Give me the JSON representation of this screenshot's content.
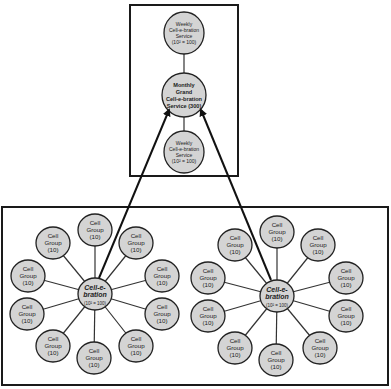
{
  "diagram": {
    "top_box": {
      "nodes": [
        {
          "id": "weekly-top",
          "lines": [
            "Weekly",
            "Cell-e-bration",
            "Service",
            "(10² = 100)"
          ],
          "cx": 184,
          "cy": 33,
          "rx": 20,
          "ry": 21
        },
        {
          "id": "monthly",
          "lines": [
            "Monthly",
            "Grand",
            "Cell-e-bration",
            "Service (300)"
          ],
          "cx": 184,
          "cy": 95,
          "rx": 22,
          "ry": 22
        },
        {
          "id": "weekly-bottom",
          "lines": [
            "Weekly",
            "Cell-e-bration",
            "Service",
            "(10² = 100)"
          ],
          "cx": 184,
          "cy": 152,
          "rx": 20,
          "ry": 21
        }
      ]
    },
    "clusters": [
      {
        "id": "left",
        "hub": {
          "title_lines": [
            "Cell-e-",
            "bration"
          ],
          "sub": "(10² = 100)",
          "cx": 95,
          "cy": 294,
          "r": 17
        },
        "satellites": [
          {
            "label_lines": [
              "Cell",
              "Group",
              "(10)"
            ],
            "cx": 95,
            "cy": 230
          },
          {
            "label_lines": [
              "Cell",
              "Group",
              "(10)"
            ],
            "cx": 136,
            "cy": 243
          },
          {
            "label_lines": [
              "Cell",
              "Group",
              "(10)"
            ],
            "cx": 162,
            "cy": 276
          },
          {
            "label_lines": [
              "Cell",
              "Group",
              "(10)"
            ],
            "cx": 162,
            "cy": 314
          },
          {
            "label_lines": [
              "Cell",
              "Group",
              "(10)"
            ],
            "cx": 136,
            "cy": 346
          },
          {
            "label_lines": [
              "Cell",
              "Group",
              "(10)"
            ],
            "cx": 94,
            "cy": 358
          },
          {
            "label_lines": [
              "Cell",
              "Group",
              "(10)"
            ],
            "cx": 53,
            "cy": 346
          },
          {
            "label_lines": [
              "Cell",
              "Group",
              "(10)"
            ],
            "cx": 27,
            "cy": 314
          },
          {
            "label_lines": [
              "Cell",
              "Group",
              "(10)"
            ],
            "cx": 28,
            "cy": 276
          },
          {
            "label_lines": [
              "Cell",
              "Group",
              "(10)"
            ],
            "cx": 53,
            "cy": 243
          }
        ]
      },
      {
        "id": "right",
        "hub": {
          "title_lines": [
            "Cell-e-",
            "bration"
          ],
          "sub": "(10² = 100)",
          "cx": 277,
          "cy": 296,
          "r": 17
        },
        "satellites": [
          {
            "label_lines": [
              "Cell",
              "Group",
              "(10)"
            ],
            "cx": 277,
            "cy": 232
          },
          {
            "label_lines": [
              "Cell",
              "Group",
              "(10)"
            ],
            "cx": 318,
            "cy": 245
          },
          {
            "label_lines": [
              "Cell",
              "Group",
              "(10)"
            ],
            "cx": 346,
            "cy": 278
          },
          {
            "label_lines": [
              "Cell",
              "Group",
              "(10)"
            ],
            "cx": 346,
            "cy": 316
          },
          {
            "label_lines": [
              "Cell",
              "Group",
              "(10)"
            ],
            "cx": 320,
            "cy": 348
          },
          {
            "label_lines": [
              "Cell",
              "Group",
              "(10)"
            ],
            "cx": 276,
            "cy": 360
          },
          {
            "label_lines": [
              "Cell",
              "Group",
              "(10)"
            ],
            "cx": 235,
            "cy": 348
          },
          {
            "label_lines": [
              "Cell",
              "Group",
              "(10)"
            ],
            "cx": 208,
            "cy": 316
          },
          {
            "label_lines": [
              "Cell",
              "Group",
              "(10)"
            ],
            "cx": 208,
            "cy": 278
          },
          {
            "label_lines": [
              "Cell",
              "Group",
              "(10)"
            ],
            "cx": 235,
            "cy": 245
          }
        ]
      }
    ],
    "arrows": [
      {
        "from": "left-hub",
        "to": "monthly",
        "x1": 99,
        "y1": 278,
        "x2": 169,
        "y2": 110
      },
      {
        "from": "right-hub",
        "to": "monthly",
        "x1": 271,
        "y1": 280,
        "x2": 201,
        "y2": 110
      }
    ],
    "colors": {
      "node_fill": "#d4d4d4",
      "stroke": "#222222",
      "background": "#ffffff"
    }
  }
}
